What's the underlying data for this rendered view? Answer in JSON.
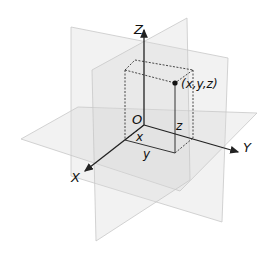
{
  "diagram": {
    "axes": {
      "x_label": "X",
      "y_label": "Y",
      "z_label": "Z"
    },
    "origin_label": "O",
    "point_label": "(x,y,z)",
    "component_labels": {
      "x": "x",
      "y": "y",
      "z": "z"
    },
    "planes": [
      "XY-plane",
      "XZ-plane",
      "YZ-plane"
    ],
    "colors": {
      "plane_fill": "#d9d9d9",
      "plane_edge": "#c8c8c8",
      "axis": "#222222",
      "background": "#ffffff"
    }
  }
}
